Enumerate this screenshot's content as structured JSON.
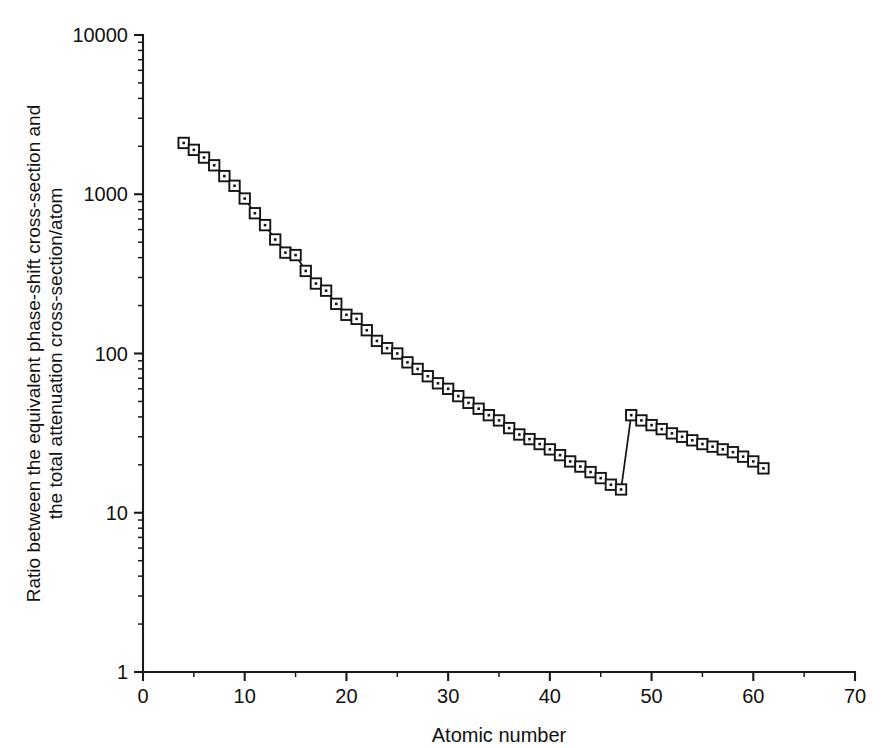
{
  "figure": {
    "background_color": "#ffffff",
    "line_color": "#111111",
    "marker_face_color": "#ffffff",
    "marker_edge_color": "#151515"
  },
  "chart_data": {
    "type": "line",
    "title": "",
    "subtitle": "",
    "xlabel": "Atomic number",
    "ylabel": "Ratio between the equivalent phase-shift cross-section and the total attenuation cross-section/atom",
    "ylabel_lines": [
      "Ratio between the equivalent phase-shift cross-section and",
      "the total attenuation cross-section/atom"
    ],
    "xlim": [
      0,
      70
    ],
    "ylim": [
      1,
      10000
    ],
    "xscale": "linear",
    "yscale": "log",
    "grid": false,
    "legend": null,
    "legend_position": "none",
    "xticks": [
      0,
      10,
      20,
      30,
      40,
      50,
      60,
      70
    ],
    "xticklabels": [
      "0",
      "10",
      "20",
      "30",
      "40",
      "50",
      "60",
      "70"
    ],
    "yticks": [
      1,
      10,
      100,
      1000,
      10000
    ],
    "yticklabels": [
      "1",
      "10",
      "100",
      "1000",
      "10000"
    ],
    "x_minor_tick_interval": 5,
    "y_minor_ticks_per_decade": 9,
    "marker": "square-with-center-dot",
    "series": [
      {
        "name": "ratio",
        "x": [
          4,
          5,
          6,
          7,
          8,
          9,
          10,
          11,
          12,
          13,
          14,
          15,
          16,
          17,
          18,
          19,
          20,
          21,
          22,
          23,
          24,
          25,
          26,
          27,
          28,
          29,
          30,
          31,
          32,
          33,
          34,
          35,
          36,
          37,
          38,
          39,
          40,
          41,
          42,
          43,
          44,
          45,
          46,
          47,
          48,
          49,
          50,
          51,
          52,
          53,
          54,
          55,
          56,
          57,
          58,
          59,
          60,
          61
        ],
        "values": [
          2100,
          1900,
          1700,
          1520,
          1300,
          1130,
          940,
          760,
          640,
          520,
          430,
          415,
          330,
          275,
          248,
          205,
          175,
          165,
          140,
          120,
          108,
          100,
          88,
          80,
          72,
          65,
          60,
          54,
          49,
          45,
          41,
          38,
          34,
          31,
          29,
          27,
          25,
          23,
          21,
          19.5,
          18,
          16.5,
          15,
          14,
          13,
          12.2,
          11.4,
          10.6,
          10.0,
          9.4,
          8.9,
          8.4,
          8.0,
          7.6,
          7.2,
          6.9,
          6.7,
          6.5
        ],
        "break_after_index": 43
      },
      {
        "name": "ratio-upper-branch",
        "x": [
          48,
          49,
          50,
          51,
          52,
          53,
          54,
          55,
          56,
          57,
          58,
          59,
          60,
          61
        ],
        "values": [
          41,
          38,
          35.5,
          33.5,
          31.5,
          30,
          28.5,
          27,
          26,
          25,
          24,
          22.5,
          21,
          19
        ]
      }
    ],
    "annotations": [
      {
        "text": "discontinuity between atomic number 47 and 48",
        "x_from": 47,
        "x_to": 48,
        "y_from": 6.5,
        "y_to": 41
      }
    ]
  }
}
